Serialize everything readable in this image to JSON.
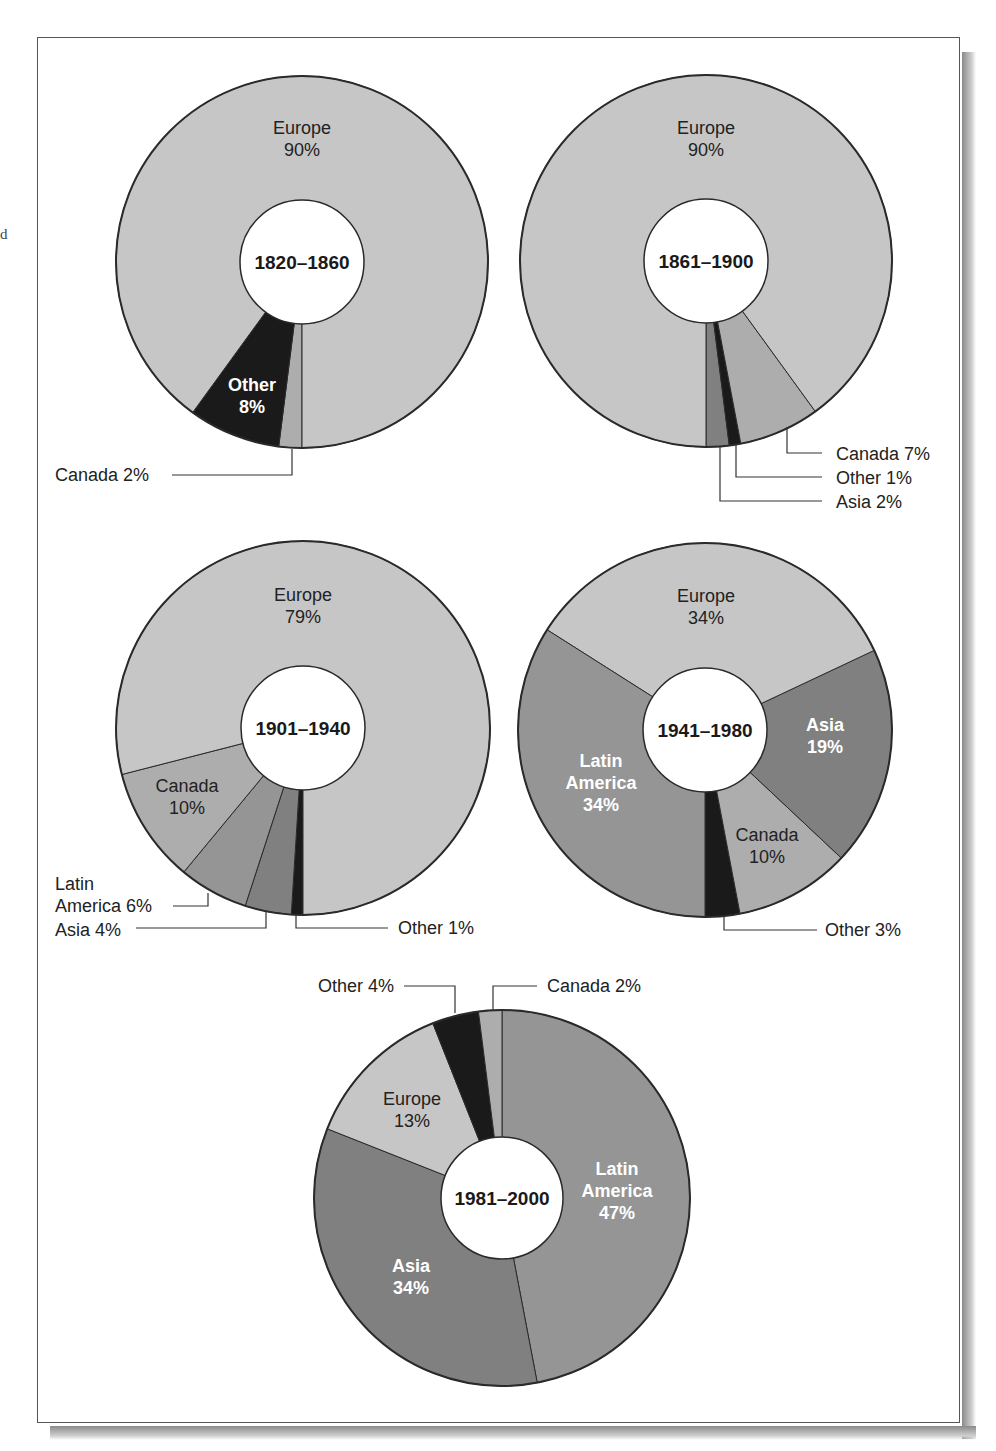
{
  "page": {
    "stray_margin_text": "d"
  },
  "style": {
    "colors": {
      "Europe": "#c6c6c6",
      "Canada": "#adadad",
      "Latin America": "#959595",
      "Asia": "#808080",
      "Other": "#1a1a1a",
      "outline": "#2a2a2a",
      "label_dark": "#222222",
      "label_light": "#ffffff"
    }
  },
  "chart_data": [
    {
      "type": "pie",
      "title": "1820–1860",
      "donut": true,
      "categories": [
        "Canada",
        "Other",
        "Europe"
      ],
      "values": [
        2,
        8,
        90
      ],
      "layout": {
        "cx": 302,
        "cy": 262,
        "r": 186,
        "r_inner": 62,
        "start_deg": 180,
        "direction": "cw"
      },
      "labels": [
        {
          "slice": "Europe",
          "lines": [
            "Europe",
            "90%"
          ],
          "x": 302,
          "y": 134,
          "color": "dark",
          "bold": false
        },
        {
          "slice": "Other",
          "lines": [
            "Other",
            "8%"
          ],
          "x": 252,
          "y": 391,
          "color": "light",
          "bold": true
        },
        {
          "slice": "Canada",
          "lines": [
            "Canada 2%"
          ],
          "x": 55,
          "y": 481,
          "anchor": "start",
          "color": "dark",
          "bold": false,
          "leader": [
            [
              292,
              449
            ],
            [
              292,
              475
            ],
            [
              172,
              475
            ]
          ]
        }
      ]
    },
    {
      "type": "pie",
      "title": "1861–1900",
      "donut": true,
      "categories": [
        "Asia",
        "Other",
        "Canada",
        "Europe"
      ],
      "values": [
        2,
        1,
        7,
        90
      ],
      "layout": {
        "cx": 706,
        "cy": 261,
        "r": 186,
        "r_inner": 62,
        "start_deg": 180,
        "direction": "ccw"
      },
      "labels": [
        {
          "slice": "Europe",
          "lines": [
            "Europe",
            "90%"
          ],
          "x": 706,
          "y": 134,
          "color": "dark",
          "bold": false
        },
        {
          "slice": "Canada",
          "lines": [
            "Canada 7%"
          ],
          "x": 836,
          "y": 460,
          "anchor": "start",
          "color": "dark",
          "bold": false,
          "leader": [
            [
              787,
              427
            ],
            [
              787,
              453
            ],
            [
              822,
              453
            ]
          ]
        },
        {
          "slice": "Other",
          "lines": [
            "Other 1%"
          ],
          "x": 836,
          "y": 484,
          "anchor": "start",
          "color": "dark",
          "bold": false,
          "leader": [
            [
              736,
              444
            ],
            [
              736,
              477
            ],
            [
              822,
              477
            ]
          ]
        },
        {
          "slice": "Asia",
          "lines": [
            "Asia 2%"
          ],
          "x": 836,
          "y": 508,
          "anchor": "start",
          "color": "dark",
          "bold": false,
          "leader": [
            [
              720,
              446
            ],
            [
              720,
              501
            ],
            [
              822,
              501
            ]
          ]
        }
      ]
    },
    {
      "type": "pie",
      "title": "1901–1940",
      "donut": true,
      "categories": [
        "Other",
        "Asia",
        "Latin America",
        "Canada",
        "Europe"
      ],
      "values": [
        1,
        4,
        6,
        10,
        79
      ],
      "layout": {
        "cx": 303,
        "cy": 728,
        "r": 187,
        "r_inner": 62,
        "start_deg": 180,
        "direction": "cw"
      },
      "labels": [
        {
          "slice": "Europe",
          "lines": [
            "Europe",
            "79%"
          ],
          "x": 303,
          "y": 601,
          "color": "dark",
          "bold": false
        },
        {
          "slice": "Canada",
          "lines": [
            "Canada",
            "10%"
          ],
          "x": 187,
          "y": 792,
          "color": "dark",
          "bold": false
        },
        {
          "slice": "Latin America",
          "lines": [
            "Latin",
            "America 6%"
          ],
          "x": 55,
          "y": 890,
          "anchor": "start",
          "color": "dark",
          "bold": false,
          "leader": [
            [
              208,
              893
            ],
            [
              208,
              906
            ],
            [
              173,
              906
            ]
          ]
        },
        {
          "slice": "Asia",
          "lines": [
            "Asia 4%"
          ],
          "x": 55,
          "y": 936,
          "anchor": "start",
          "color": "dark",
          "bold": false,
          "leader": [
            [
              266,
              911
            ],
            [
              266,
              928
            ],
            [
              136,
              928
            ]
          ]
        },
        {
          "slice": "Other",
          "lines": [
            "Other 1%"
          ],
          "x": 398,
          "y": 934,
          "anchor": "start",
          "color": "dark",
          "bold": false,
          "leader": [
            [
              296,
              915
            ],
            [
              296,
              928
            ],
            [
              388,
              928
            ]
          ]
        }
      ]
    },
    {
      "type": "pie",
      "title": "1941–1980",
      "donut": true,
      "categories": [
        "Other",
        "Canada",
        "Asia",
        "Europe",
        "Latin America"
      ],
      "values": [
        3,
        10,
        19,
        34,
        34
      ],
      "layout": {
        "cx": 705,
        "cy": 730,
        "r": 187,
        "r_inner": 62,
        "start_deg": 180,
        "direction": "ccw"
      },
      "labels": [
        {
          "slice": "Europe",
          "lines": [
            "Europe",
            "34%"
          ],
          "x": 706,
          "y": 602,
          "color": "dark",
          "bold": false
        },
        {
          "slice": "Asia",
          "lines": [
            "Asia",
            "19%"
          ],
          "x": 825,
          "y": 731,
          "color": "light",
          "bold": true
        },
        {
          "slice": "Latin America",
          "lines": [
            "Latin",
            "America",
            "34%"
          ],
          "x": 601,
          "y": 767,
          "color": "light",
          "bold": true
        },
        {
          "slice": "Canada",
          "lines": [
            "Canada",
            "10%"
          ],
          "x": 767,
          "y": 841,
          "color": "dark",
          "bold": false
        },
        {
          "slice": "Other",
          "lines": [
            "Other 3%"
          ],
          "x": 825,
          "y": 936,
          "anchor": "start",
          "color": "dark",
          "bold": false,
          "leader": [
            [
              724,
              916
            ],
            [
              724,
              930
            ],
            [
              817,
              930
            ]
          ]
        }
      ]
    },
    {
      "type": "pie",
      "title": "1981–2000",
      "donut": true,
      "categories": [
        "Latin America",
        "Asia",
        "Europe",
        "Other",
        "Canada"
      ],
      "values": [
        47,
        34,
        13,
        4,
        2
      ],
      "layout": {
        "cx": 502,
        "cy": 1198,
        "r": 188,
        "r_inner": 61,
        "start_deg": 0,
        "direction": "cw"
      },
      "labels": [
        {
          "slice": "Latin America",
          "lines": [
            "Latin",
            "America",
            "47%"
          ],
          "x": 617,
          "y": 1175,
          "color": "light",
          "bold": true
        },
        {
          "slice": "Asia",
          "lines": [
            "Asia",
            "34%"
          ],
          "x": 411,
          "y": 1272,
          "color": "light",
          "bold": true
        },
        {
          "slice": "Europe",
          "lines": [
            "Europe",
            "13%"
          ],
          "x": 412,
          "y": 1105,
          "color": "dark",
          "bold": false
        },
        {
          "slice": "Other",
          "lines": [
            "Other 4%"
          ],
          "x": 394,
          "y": 992,
          "anchor": "end",
          "color": "dark",
          "bold": false,
          "leader": [
            [
              455,
              1013
            ],
            [
              455,
              986
            ],
            [
              404,
              986
            ]
          ]
        },
        {
          "slice": "Canada",
          "lines": [
            "Canada 2%"
          ],
          "x": 547,
          "y": 992,
          "anchor": "start",
          "color": "dark",
          "bold": false,
          "leader": [
            [
              493,
              1011
            ],
            [
              493,
              986
            ],
            [
              537,
              986
            ]
          ]
        }
      ]
    }
  ]
}
